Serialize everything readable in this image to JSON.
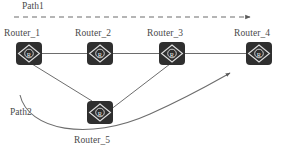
{
  "diagram": {
    "type": "network-topology",
    "title_absent": true,
    "background_color": "#ffffff",
    "node_fill_color": "#2f2f2f",
    "node_glyph_color": "#e8e8e8",
    "link_color": "#6b6b6b",
    "text_color": "#4a4a4a"
  },
  "routers": [
    {
      "id": "router-1",
      "label": "Router_1",
      "icon": "router-icon",
      "glyph": "R",
      "x": 16,
      "y": 42,
      "label_x": 4,
      "label_y": 29
    },
    {
      "id": "router-2",
      "label": "Router_2",
      "icon": "router-icon",
      "glyph": "R",
      "x": 87,
      "y": 42,
      "label_x": 75,
      "label_y": 29
    },
    {
      "id": "router-3",
      "label": "Router_3",
      "icon": "router-icon",
      "glyph": "R",
      "x": 159,
      "y": 42,
      "label_x": 147,
      "label_y": 29
    },
    {
      "id": "router-4",
      "label": "Router_4",
      "icon": "router-icon",
      "glyph": "R",
      "x": 246,
      "y": 42,
      "label_x": 234,
      "label_y": 29
    },
    {
      "id": "router-5",
      "label": "Router_5",
      "icon": "router-icon",
      "glyph": "R",
      "x": 87,
      "y": 101,
      "label_x": 74,
      "label_y": 136
    }
  ],
  "links": [
    {
      "id": "link-r1-r2",
      "from": "router-1",
      "to": "router-2",
      "style": "solid"
    },
    {
      "id": "link-r2-r3",
      "from": "router-2",
      "to": "router-3",
      "style": "solid"
    },
    {
      "id": "link-r3-r4",
      "from": "router-3",
      "to": "router-4",
      "style": "solid"
    },
    {
      "id": "link-r1-r5",
      "from": "router-1",
      "to": "router-5",
      "style": "solid"
    },
    {
      "id": "link-r5-r3",
      "from": "router-5",
      "to": "router-3",
      "style": "solid"
    }
  ],
  "paths": [
    {
      "id": "path1",
      "label": "Path1",
      "style": "dashed",
      "arrow": "right",
      "label_x": 22,
      "label_y": 1,
      "line_y": 17,
      "line_x_start": 14,
      "line_x_end": 252
    },
    {
      "id": "path2",
      "label": "Path2",
      "style": "solid-curve",
      "arrow": "right",
      "label_x": 10,
      "label_y": 107,
      "curve": "M 20,95 C 30,132 90,140 150,115 C 190,98 212,82 232,73"
    }
  ]
}
